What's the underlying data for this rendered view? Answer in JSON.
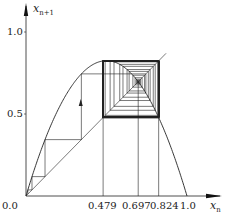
{
  "figure": {
    "type": "cobweb-diagram",
    "map": "logistic",
    "r": 3.3,
    "x_axis_label": "x",
    "x_axis_sub": "n",
    "y_axis_label": "x",
    "y_axis_sub": "n+1",
    "x_ticks": [
      {
        "value": 0.0,
        "label": "0.0"
      },
      {
        "value": 0.479,
        "label": "0.479"
      },
      {
        "value": 0.697,
        "label": "0.697"
      },
      {
        "value": 0.824,
        "label": "0.824"
      },
      {
        "value": 1.0,
        "label": "1.0"
      }
    ],
    "y_ticks": [
      {
        "value": 0.5,
        "label": "0.5"
      },
      {
        "value": 1.0,
        "label": "1.0"
      }
    ],
    "cycle_points": [
      0.479,
      0.824
    ],
    "fixed_point": 0.697,
    "outer_orbit_start": 0.0114,
    "inner_orbit_start": 0.7,
    "arrow_at_x": 0.34,
    "colors": {
      "line": "#222222",
      "axis": "#111111"
    }
  }
}
